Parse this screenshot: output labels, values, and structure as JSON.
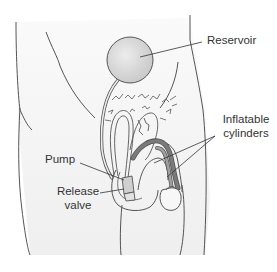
{
  "diagram": {
    "type": "anatomical-illustration",
    "labels": {
      "reservoir": "Reservoir",
      "inflatable_line1": "Inflatable",
      "inflatable_line2": "cylinders",
      "pump": "Pump",
      "release_line1": "Release",
      "release_line2": "valve"
    },
    "colors": {
      "outline": "#4a4a4a",
      "skin": "#f4f4f4",
      "reservoir_fill": "#dcdcdc",
      "cylinder_fill": "#7a7a7a",
      "pump_fill": "#cfcfcf",
      "label_text": "#333333"
    }
  }
}
